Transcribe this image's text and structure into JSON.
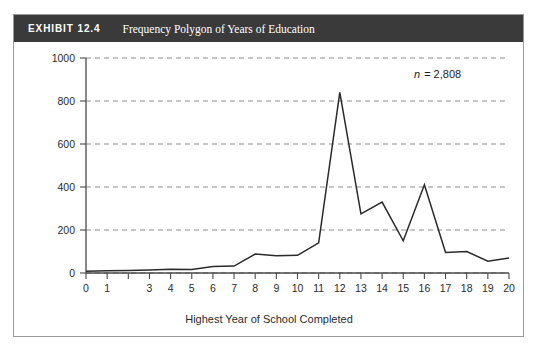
{
  "exhibit": {
    "number": "EXHIBIT 12.4",
    "title": "Frequency Polygon of Years of Education"
  },
  "annotation": {
    "symbol": "n",
    "equals_value": "= 2,808",
    "full_text": "n = 2,808"
  },
  "chart_data": {
    "type": "line",
    "title": "Frequency Polygon of Years of Education",
    "xlabel": "Highest Year of School Completed",
    "ylabel": "",
    "x": [
      0,
      1,
      2,
      3,
      4,
      5,
      6,
      7,
      8,
      9,
      10,
      11,
      12,
      13,
      14,
      15,
      16,
      17,
      18,
      19,
      20
    ],
    "values": [
      8,
      10,
      12,
      14,
      18,
      16,
      30,
      32,
      88,
      80,
      82,
      140,
      840,
      275,
      330,
      150,
      410,
      95,
      100,
      55,
      70
    ],
    "x_tick_labels": [
      "0",
      "1",
      "",
      "3",
      "4",
      "5",
      "6",
      "7",
      "8",
      "9",
      "10",
      "11",
      "12",
      "13",
      "14",
      "15",
      "16",
      "17",
      "18",
      "19",
      "20"
    ],
    "y_ticks": [
      0,
      200,
      400,
      600,
      800,
      1000
    ],
    "y_tick_labels": [
      "0",
      "200",
      "400",
      "600",
      "800",
      "1000"
    ],
    "xlim": [
      0,
      20
    ],
    "ylim": [
      0,
      1000
    ],
    "grid": true,
    "legend": false,
    "annotations": [
      "n = 2,808"
    ]
  }
}
